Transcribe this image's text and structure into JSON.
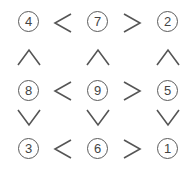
{
  "puzzle": {
    "type": "futoshiki",
    "grid": [
      [
        4,
        7,
        2
      ],
      [
        8,
        9,
        5
      ],
      [
        3,
        6,
        1
      ]
    ],
    "cells": {
      "r0c0": "4",
      "r0c1": "7",
      "r0c2": "2",
      "r1c0": "8",
      "r1c1": "9",
      "r1c2": "5",
      "r2c0": "3",
      "r2c1": "6",
      "r2c2": "1"
    },
    "horizontal_signs": [
      [
        "<",
        ">"
      ],
      [
        "<",
        ">"
      ],
      [
        "<",
        ">"
      ]
    ],
    "vertical_signs": [
      [
        "^",
        "^",
        "^"
      ],
      [
        "v",
        "v",
        "v"
      ]
    ],
    "colors": {
      "stroke": "#555555",
      "text": "#444444",
      "background": "#ffffff"
    }
  }
}
